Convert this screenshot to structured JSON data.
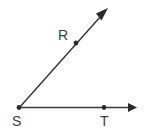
{
  "figure": {
    "kind": "angle-diagram",
    "canvas": {
      "width": 146,
      "height": 134,
      "background": "#ffffff"
    },
    "style": {
      "line_color": "#3a3a3a",
      "line_width": 1.5,
      "marker_color": "#2b2b2b",
      "label_color": "#3d3d3d",
      "label_font_size": 14
    },
    "vertex": {
      "name": "S",
      "label": "S",
      "x": 19,
      "y": 108,
      "label_x": 12,
      "label_y": 126,
      "has_dot": true
    },
    "points": [
      {
        "name": "R",
        "label": "R",
        "x": 76,
        "y": 43,
        "label_x": 58,
        "label_y": 40,
        "has_dot": true,
        "on_ray": "SR"
      },
      {
        "name": "T",
        "label": "T",
        "x": 104,
        "y": 107,
        "label_x": 100,
        "label_y": 126,
        "has_dot": true,
        "on_ray": "ST"
      }
    ],
    "rays": [
      {
        "name": "ray-SR",
        "from": "S",
        "through": "R",
        "start_x": 19,
        "start_y": 108,
        "end_x": 108,
        "end_y": 8,
        "arrow_at_end": true,
        "angle_degrees": 48
      },
      {
        "name": "ray-ST",
        "from": "S",
        "through": "T",
        "start_x": 19,
        "start_y": 108,
        "end_x": 137,
        "end_y": 107,
        "arrow_at_end": true,
        "angle_degrees": 0
      }
    ],
    "arrowheads": [
      {
        "name": "arrowhead-SR",
        "tip_x": 108,
        "tip_y": 8,
        "rotation": -48
      },
      {
        "name": "arrowhead-ST",
        "tip_x": 137,
        "tip_y": 107,
        "rotation": 0
      }
    ]
  }
}
